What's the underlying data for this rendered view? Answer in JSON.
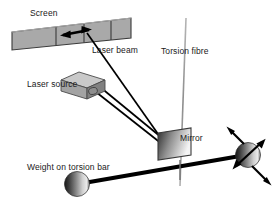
{
  "diagram": {
    "labels": {
      "screen": "Screen",
      "laser_beam": "Laser beam",
      "laser_source": "Laser source",
      "torsion_fibre": "Torsion fibre",
      "mirror": "Mirror",
      "weight": "Weight on torsion bar"
    },
    "colors": {
      "screen_fill": "#a9a9a9",
      "screen_stroke": "#3a3a3a",
      "mirror_dark": "#2b2b2b",
      "mirror_light": "#f2f2f2",
      "sphere_dark": "#1c1c1c",
      "sphere_light": "#e8e8e8",
      "box_top": "#c9c9c9",
      "box_front": "#9a9a9a",
      "box_side": "#7d7d7d",
      "line": "#000000",
      "fibre": "#9a9a9a",
      "text": "#1a1a1a"
    },
    "parts": [
      {
        "name": "screen",
        "shape": "tilted-bar",
        "segments": 4
      },
      {
        "name": "screen-arrow",
        "shape": "double-headed-arrow"
      },
      {
        "name": "laser-source",
        "shape": "cuboid"
      },
      {
        "name": "laser-beam",
        "shape": "two-parallel-rays"
      },
      {
        "name": "torsion-fibre",
        "shape": "vertical-line"
      },
      {
        "name": "mirror",
        "shape": "parallelogram-gradient"
      },
      {
        "name": "torsion-bar",
        "shape": "thick-line"
      },
      {
        "name": "weight-left",
        "shape": "sphere"
      },
      {
        "name": "weight-right",
        "shape": "sphere"
      },
      {
        "name": "weight-right-arrow",
        "shape": "double-headed-arrow"
      }
    ]
  }
}
